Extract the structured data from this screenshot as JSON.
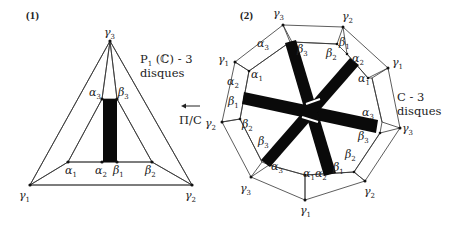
{
  "figure": {
    "panel1": {
      "label": "(1)",
      "caption_line1": "P",
      "caption_sub": "1",
      "caption_rest": " (ℂ) - 3",
      "caption_line2": "disques",
      "vertices": {
        "gamma1": {
          "sym": "γ",
          "sub": "1"
        },
        "gamma2": {
          "sym": "γ",
          "sub": "2"
        },
        "gamma3": {
          "sym": "γ",
          "sub": "3"
        },
        "alpha1": {
          "sym": "α",
          "sub": "1"
        },
        "alpha2": {
          "sym": "α",
          "sub": "2"
        },
        "alpha3": {
          "sym": "α",
          "sub": "3"
        },
        "beta1": {
          "sym": "β",
          "sub": "1"
        },
        "beta2": {
          "sym": "β",
          "sub": "2"
        },
        "beta3": {
          "sym": "β",
          "sub": "3"
        }
      }
    },
    "arrow": {
      "label": "Π/C",
      "glyph": "←"
    },
    "panel2": {
      "label": "(2)",
      "caption_line1": "C - 3",
      "caption_line2": "disques",
      "outer_vertices": [
        "γ3",
        "γ2",
        "γ1",
        "γ3",
        "γ2",
        "γ1",
        "γ3",
        "γ2",
        "γ1"
      ],
      "inner_pairs": [
        {
          "a": "β3",
          "b": "β2"
        },
        {
          "a": "β1",
          "b": "α2"
        },
        {
          "a": "α1",
          "b": "α3"
        },
        {
          "a": "β3",
          "b": "β2"
        },
        {
          "a": "β1",
          "b": "α2"
        },
        {
          "a": "α1",
          "b": "α3"
        },
        {
          "a": "β3",
          "b": "β2"
        },
        {
          "a": "β1",
          "b": "α2"
        },
        {
          "a": "α1",
          "b": "α3"
        }
      ]
    },
    "colors": {
      "line": "#333333",
      "band_fill": "#d6d6d6",
      "bar": "#0a0a0a",
      "background": "#ffffff"
    }
  }
}
